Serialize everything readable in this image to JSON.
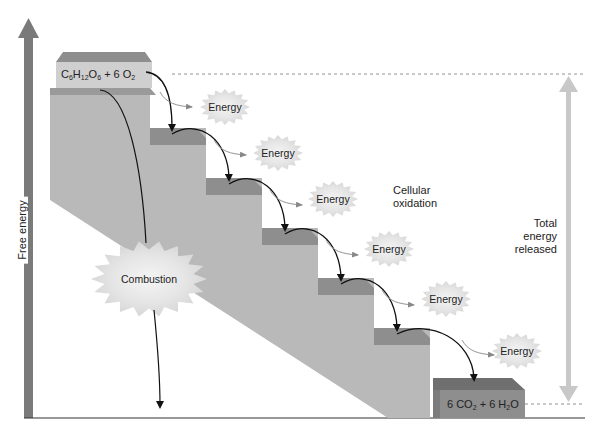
{
  "diagram": {
    "y_axis_label": "Free energy",
    "reactants": {
      "label_parts": [
        "C",
        "6",
        "H",
        "12",
        "O",
        "6",
        " + 6 O",
        "2"
      ],
      "text": "C6H12O6 + 6 O2"
    },
    "products": {
      "label_parts": [
        "6 CO",
        "2",
        " + 6 H",
        "2",
        "O"
      ],
      "text": "6 CO2 + 6 H2O"
    },
    "pathways": {
      "combustion": "Combustion",
      "cellular": "Cellular oxidation",
      "cellular_line1": "Cellular",
      "cellular_line2": "oxidation"
    },
    "total": {
      "line1": "Total",
      "line2": "energy",
      "line3": "released"
    },
    "energy_bursts": [
      {
        "label": "Energy"
      },
      {
        "label": "Energy"
      },
      {
        "label": "Energy"
      },
      {
        "label": "Energy"
      },
      {
        "label": "Energy"
      },
      {
        "label": "Energy"
      }
    ],
    "colors": {
      "step_face": "#b9b9b9",
      "step_top": "#8e8e8e",
      "axis_arrow": "#7a7a7a",
      "total_arrow": "#c8c8c8",
      "burst": "#e3e3e3"
    }
  }
}
